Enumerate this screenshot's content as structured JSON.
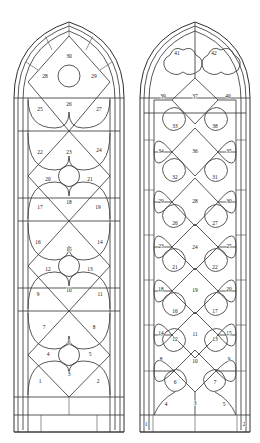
{
  "figure": {
    "background_color": "#ffffff",
    "line_color": "#3a3a3a",
    "label_color": "#111111",
    "panel_count_total": 72
  },
  "windows": [
    {
      "id": "left-window",
      "name": "Left lancet window",
      "tracery_style": "diamond lattice with central roundels",
      "panel_number_range": "1-30",
      "bounds": {
        "x": 14,
        "y": 22,
        "width": 110,
        "height": 410
      },
      "tiers": 5,
      "labels": [
        {
          "n": "1",
          "x": 40.0,
          "y": 382.0
        },
        {
          "n": "2",
          "x": 98.0,
          "y": 382.0
        },
        {
          "n": "3",
          "x": 69.0,
          "y": 375.0
        },
        {
          "n": "4",
          "x": 48.0,
          "y": 355.0
        },
        {
          "n": "5",
          "x": 90.0,
          "y": 355.0
        },
        {
          "n": "6",
          "x": 69.0,
          "y": 343.0
        },
        {
          "n": "7",
          "x": 44.0,
          "y": 328.0
        },
        {
          "n": "8",
          "x": 94.0,
          "y": 328.0
        },
        {
          "n": "9",
          "x": 38.0,
          "y": 295.0
        },
        {
          "n": "10",
          "x": 69.0,
          "y": 291.0
        },
        {
          "n": "11",
          "x": 100.0,
          "y": 295.0
        },
        {
          "n": "12",
          "x": 48.0,
          "y": 270.0
        },
        {
          "n": "13",
          "x": 90.0,
          "y": 270.0
        },
        {
          "n": "14",
          "x": 100.0,
          "y": 243.0
        },
        {
          "n": "15",
          "x": 69.0,
          "y": 250.0
        },
        {
          "n": "16",
          "x": 38.0,
          "y": 243.0
        },
        {
          "n": "17",
          "x": 40.0,
          "y": 208.0
        },
        {
          "n": "18",
          "x": 69.0,
          "y": 203.0
        },
        {
          "n": "19",
          "x": 98.0,
          "y": 208.0
        },
        {
          "n": "20",
          "x": 48.0,
          "y": 180.0
        },
        {
          "n": "21",
          "x": 90.0,
          "y": 180.0
        },
        {
          "n": "22",
          "x": 40.0,
          "y": 153.0
        },
        {
          "n": "23",
          "x": 69.0,
          "y": 153.0
        },
        {
          "n": "24",
          "x": 99.0,
          "y": 151.0
        },
        {
          "n": "25",
          "x": 40.0,
          "y": 110.0
        },
        {
          "n": "26",
          "x": 69.0,
          "y": 105.0
        },
        {
          "n": "27",
          "x": 99.0,
          "y": 110.0
        },
        {
          "n": "28",
          "x": 45.0,
          "y": 77.0
        },
        {
          "n": "29",
          "x": 94.0,
          "y": 77.0
        },
        {
          "n": "30",
          "x": 69.0,
          "y": 57.0
        }
      ]
    },
    {
      "id": "right-window",
      "name": "Right lancet window",
      "tracery_style": "quatrefoil and lobed lattice with border strips",
      "panel_number_range": "1-42",
      "bounds": {
        "x": 140,
        "y": 22,
        "width": 110,
        "height": 410
      },
      "tiers": 6,
      "labels": [
        {
          "n": "1",
          "x": 146.0,
          "y": 425.0
        },
        {
          "n": "2",
          "x": 244.0,
          "y": 425.0
        },
        {
          "n": "3",
          "x": 195.0,
          "y": 404.0
        },
        {
          "n": "4",
          "x": 166.0,
          "y": 405.0
        },
        {
          "n": "5",
          "x": 224.0,
          "y": 405.0
        },
        {
          "n": "6",
          "x": 175.0,
          "y": 383.0
        },
        {
          "n": "7",
          "x": 215.0,
          "y": 383.0
        },
        {
          "n": "8",
          "x": 161.0,
          "y": 360.0
        },
        {
          "n": "9",
          "x": 229.0,
          "y": 360.0
        },
        {
          "n": "10",
          "x": 195.0,
          "y": 362.0
        },
        {
          "n": "11",
          "x": 195.0,
          "y": 335.0
        },
        {
          "n": "12",
          "x": 175.0,
          "y": 340.0
        },
        {
          "n": "13",
          "x": 215.0,
          "y": 340.0
        },
        {
          "n": "14",
          "x": 161.0,
          "y": 334.0
        },
        {
          "n": "15",
          "x": 229.0,
          "y": 334.0
        },
        {
          "n": "16",
          "x": 175.0,
          "y": 312.0
        },
        {
          "n": "17",
          "x": 215.0,
          "y": 312.0
        },
        {
          "n": "18",
          "x": 161.0,
          "y": 290.0
        },
        {
          "n": "19",
          "x": 195.0,
          "y": 291.0
        },
        {
          "n": "20",
          "x": 229.0,
          "y": 290.0
        },
        {
          "n": "21",
          "x": 175.0,
          "y": 268.0
        },
        {
          "n": "22",
          "x": 215.0,
          "y": 268.0
        },
        {
          "n": "23",
          "x": 161.0,
          "y": 247.0
        },
        {
          "n": "24",
          "x": 195.0,
          "y": 248.0
        },
        {
          "n": "25",
          "x": 229.0,
          "y": 247.0
        },
        {
          "n": "26",
          "x": 175.0,
          "y": 224.0
        },
        {
          "n": "27",
          "x": 215.0,
          "y": 224.0
        },
        {
          "n": "28",
          "x": 195.0,
          "y": 202.0
        },
        {
          "n": "29",
          "x": 161.0,
          "y": 202.0
        },
        {
          "n": "30",
          "x": 229.0,
          "y": 202.0
        },
        {
          "n": "31",
          "x": 215.0,
          "y": 178.0
        },
        {
          "n": "32",
          "x": 175.0,
          "y": 178.0
        },
        {
          "n": "33",
          "x": 175.0,
          "y": 127.0
        },
        {
          "n": "34",
          "x": 161.0,
          "y": 152.0
        },
        {
          "n": "35",
          "x": 229.0,
          "y": 152.0
        },
        {
          "n": "36",
          "x": 195.0,
          "y": 152.0
        },
        {
          "n": "37",
          "x": 195.0,
          "y": 97.0
        },
        {
          "n": "38",
          "x": 215.0,
          "y": 127.0
        },
        {
          "n": "39",
          "x": 163.0,
          "y": 97.0
        },
        {
          "n": "40",
          "x": 228.0,
          "y": 97.0
        },
        {
          "n": "41",
          "x": 177.0,
          "y": 54.0
        },
        {
          "n": "42",
          "x": 214.0,
          "y": 54.0
        }
      ]
    }
  ]
}
